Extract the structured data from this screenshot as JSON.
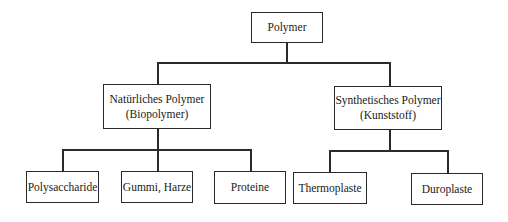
{
  "diagram": {
    "type": "tree",
    "root": {
      "label": "Polymer"
    },
    "level1": [
      {
        "line1": "Natürliches Polymer",
        "line2": "(Biopolymer)"
      },
      {
        "line1": "Synthetisches Polymer",
        "line2": "(Kunststoff)"
      }
    ],
    "level2": {
      "natural": [
        {
          "label": "Polysaccharide"
        },
        {
          "label": "Gummi, Harze"
        },
        {
          "label": "Proteine"
        }
      ],
      "synthetic": [
        {
          "label": "Thermoplaste"
        },
        {
          "label": "Duroplaste"
        }
      ]
    },
    "colors": {
      "line": "#2a2a2a",
      "text": "#1a1a1a",
      "background": "#ffffff"
    }
  }
}
